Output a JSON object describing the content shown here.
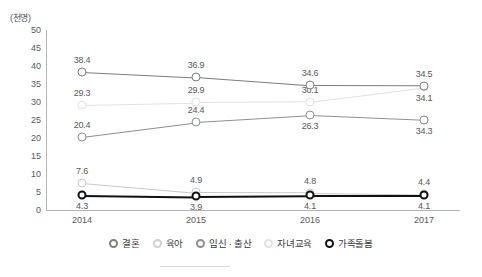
{
  "axis": {
    "unit_label": "(천명)",
    "y_ticks": [
      "50",
      "45",
      "40",
      "35",
      "30",
      "25",
      "20",
      "15",
      "10",
      "5",
      "0"
    ],
    "x_ticks": [
      "2014",
      "2015",
      "2016",
      "2017"
    ]
  },
  "legend": {
    "items": [
      {
        "label": "결혼",
        "color": "#7d7d7d",
        "marker": "circle-outline"
      },
      {
        "label": "육아",
        "color": "#d0d0d0",
        "marker": "circle-outline"
      },
      {
        "label": "임신 · 출산",
        "color": "#8f8f8f",
        "marker": "circle-outline"
      },
      {
        "label": "자녀교육",
        "color": "#e2e2e2",
        "marker": "circle-outline"
      },
      {
        "label": "가족돌봄",
        "color": "#111111",
        "marker": "circle-outline-bold"
      }
    ]
  },
  "chart_data": {
    "type": "line",
    "title": "",
    "xlabel": "",
    "ylabel": "(천명)",
    "ylim": [
      0,
      50
    ],
    "ytick_step": 5,
    "grid": false,
    "legend_position": "bottom",
    "categories": [
      "2014",
      "2015",
      "2016",
      "2017"
    ],
    "series": [
      {
        "name": "결혼",
        "color": "#7d7d7d",
        "values": [
          38.4,
          36.9,
          34.6,
          34.5
        ],
        "labels": [
          "38.4",
          "36.9",
          "34.6",
          "34.5"
        ],
        "label_pos": [
          "above",
          "above",
          "above",
          "above"
        ]
      },
      {
        "name": "육아",
        "color": "#8f8f8f",
        "values": [
          20.4,
          24.4,
          26.3,
          25.0
        ],
        "labels": [
          "20.4",
          "24.4",
          "26.3",
          "34.3"
        ],
        "label_pos": [
          "above",
          "above",
          "below",
          "below"
        ]
      },
      {
        "name": "임신 · 출산",
        "color": "#c9c9c9",
        "values": [
          7.6,
          4.9,
          4.8,
          4.4
        ],
        "labels": [
          "7.6",
          "4.9",
          "4.8",
          "4.4"
        ],
        "label_pos": [
          "above",
          "above",
          "above",
          "above"
        ]
      },
      {
        "name": "자녀교육",
        "color": "#e2e2e2",
        "values": [
          29.3,
          29.9,
          30.1,
          34.1
        ],
        "labels": [
          "29.3",
          "29.9",
          "30.1",
          "34.1"
        ],
        "label_pos": [
          "above",
          "above",
          "above",
          "below"
        ]
      },
      {
        "name": "가족돌봄",
        "color": "#111111",
        "values": [
          4.3,
          3.9,
          4.1,
          4.1
        ],
        "labels": [
          "4.3",
          "3.9",
          "4.1",
          "4.1"
        ],
        "label_pos": [
          "below",
          "below",
          "below",
          "below"
        ]
      }
    ]
  }
}
